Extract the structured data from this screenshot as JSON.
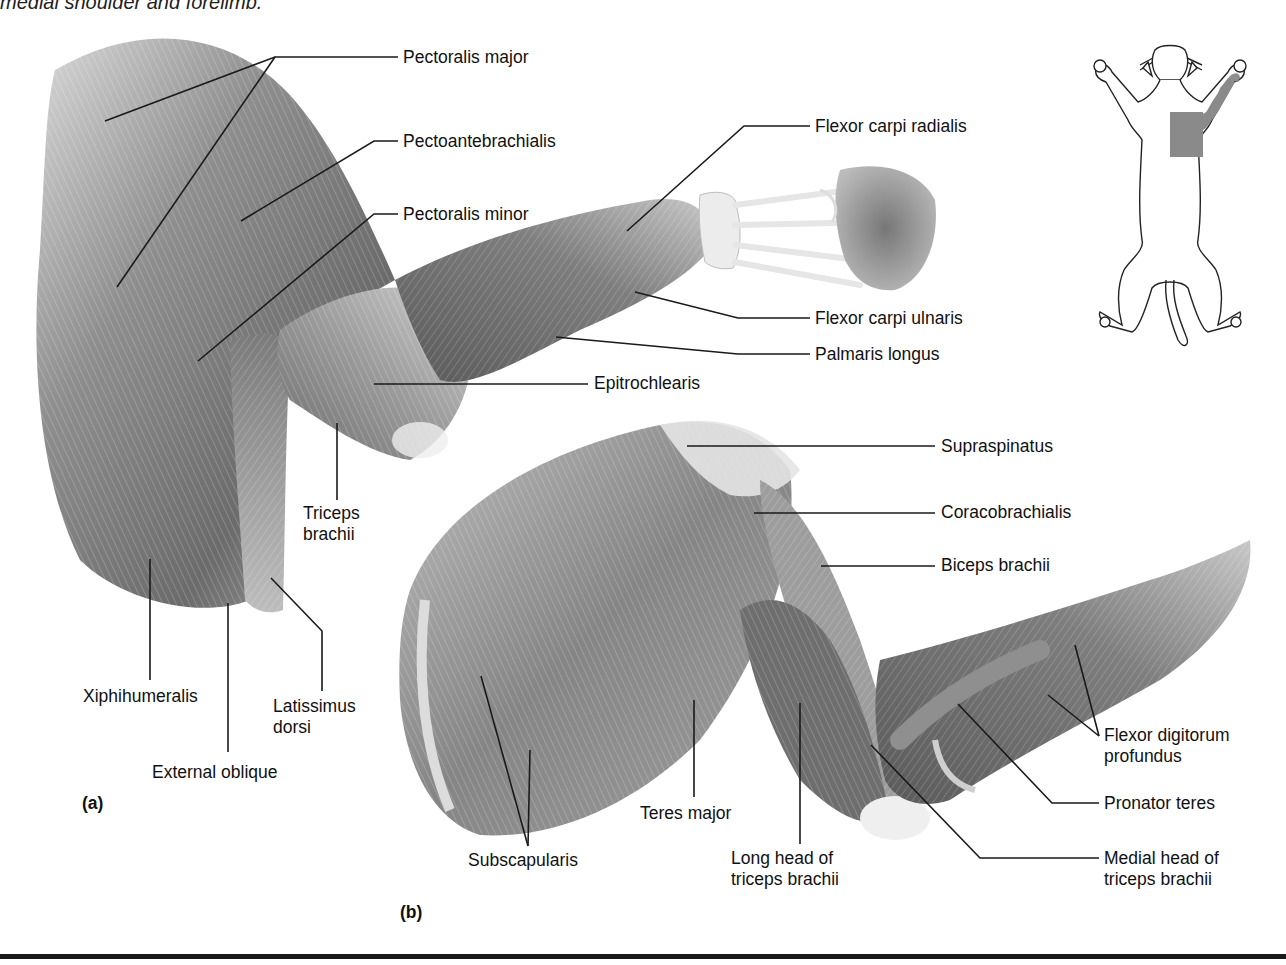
{
  "figure": {
    "caption_fragment": "medial shoulder and forelimb.",
    "panels": [
      {
        "id": "a",
        "letter": "(a)"
      },
      {
        "id": "b",
        "letter": "(b)"
      }
    ],
    "orientation_inset": {
      "description": "Cat outline, ventral view, shaded right shoulder and forelimb region",
      "highlight_color": "#8a8a8a"
    },
    "colors": {
      "muscle_dark": "#4a4a4a",
      "muscle_mid": "#8c8c8c",
      "muscle_light": "#d6d6d6",
      "tendon": "#efefef",
      "leader_line": "#1a1a1a",
      "text": "#111111"
    }
  },
  "labels": {
    "pectoralis_major": {
      "text": "Pectoralis major",
      "x": 403,
      "y": 47
    },
    "pectoantebrachialis": {
      "text": "Pectoantebrachialis",
      "x": 403,
      "y": 131
    },
    "pectoralis_minor": {
      "text": "Pectoralis minor",
      "x": 403,
      "y": 204
    },
    "flexor_carpi_radialis": {
      "text": "Flexor carpi radialis",
      "x": 815,
      "y": 116
    },
    "flexor_carpi_ulnaris": {
      "text": "Flexor carpi ulnaris",
      "x": 815,
      "y": 308
    },
    "palmaris_longus": {
      "text": "Palmaris longus",
      "x": 815,
      "y": 344
    },
    "epitrochlearis": {
      "text": "Epitrochlearis",
      "x": 594,
      "y": 373
    },
    "triceps_brachii_a": {
      "text": [
        "Triceps",
        "brachii"
      ],
      "x": 303,
      "y": 503
    },
    "xiphihumeralis": {
      "text": "Xiphihumeralis",
      "x": 83,
      "y": 686
    },
    "latissimus_dorsi": {
      "text": [
        "Latissimus",
        "dorsi"
      ],
      "x": 273,
      "y": 696
    },
    "external_oblique": {
      "text": "External oblique",
      "x": 152,
      "y": 762
    },
    "supraspinatus": {
      "text": "Supraspinatus",
      "x": 941,
      "y": 436
    },
    "coracobrachialis": {
      "text": "Coracobrachialis",
      "x": 941,
      "y": 502
    },
    "biceps_brachii": {
      "text": "Biceps brachii",
      "x": 941,
      "y": 555
    },
    "flexor_digitorum_profundus": {
      "text": [
        "Flexor digitorum",
        "profundus"
      ],
      "x": 1104,
      "y": 725
    },
    "pronator_teres": {
      "text": "Pronator teres",
      "x": 1104,
      "y": 793
    },
    "medial_head_triceps": {
      "text": [
        "Medial head of",
        "triceps brachii"
      ],
      "x": 1104,
      "y": 848
    },
    "subscapularis": {
      "text": "Subscapularis",
      "x": 468,
      "y": 850
    },
    "teres_major": {
      "text": "Teres major",
      "x": 640,
      "y": 803
    },
    "long_head_triceps": {
      "text": [
        "Long head of",
        "triceps brachii"
      ],
      "x": 731,
      "y": 848
    }
  },
  "leaders": [
    {
      "label": "pectoralis_major",
      "points": [
        [
          398,
          57
        ],
        [
          275,
          57
        ],
        [
          105,
          121
        ]
      ]
    },
    {
      "label": "pectoralis_major",
      "points": [
        [
          275,
          57
        ],
        [
          117,
          287
        ]
      ]
    },
    {
      "label": "pectoantebrachialis",
      "points": [
        [
          398,
          141
        ],
        [
          374,
          141
        ],
        [
          241,
          221
        ]
      ]
    },
    {
      "label": "pectoralis_minor",
      "points": [
        [
          398,
          214
        ],
        [
          374,
          214
        ],
        [
          198,
          361
        ]
      ]
    },
    {
      "label": "flexor_carpi_radialis",
      "points": [
        [
          810,
          126
        ],
        [
          744,
          126
        ],
        [
          627,
          231
        ]
      ]
    },
    {
      "label": "flexor_carpi_ulnaris",
      "points": [
        [
          810,
          318
        ],
        [
          738,
          318
        ],
        [
          635,
          292
        ]
      ]
    },
    {
      "label": "palmaris_longus",
      "points": [
        [
          810,
          354
        ],
        [
          738,
          354
        ],
        [
          556,
          337
        ]
      ]
    },
    {
      "label": "epitrochlearis",
      "points": [
        [
          588,
          384
        ],
        [
          374,
          384
        ]
      ]
    },
    {
      "label": "triceps_brachii_a",
      "points": [
        [
          337,
          500
        ],
        [
          337,
          423
        ]
      ]
    },
    {
      "label": "xiphihumeralis",
      "points": [
        [
          150,
          680
        ],
        [
          150,
          559
        ]
      ]
    },
    {
      "label": "latissimus_dorsi",
      "points": [
        [
          322,
          691
        ],
        [
          322,
          631
        ],
        [
          271,
          578
        ]
      ]
    },
    {
      "label": "external_oblique",
      "points": [
        [
          228,
          752
        ],
        [
          228,
          603
        ]
      ]
    },
    {
      "label": "supraspinatus",
      "points": [
        [
          935,
          446
        ],
        [
          687,
          446
        ]
      ]
    },
    {
      "label": "coracobrachialis",
      "points": [
        [
          935,
          513
        ],
        [
          754,
          513
        ]
      ]
    },
    {
      "label": "biceps_brachii",
      "points": [
        [
          935,
          566
        ],
        [
          821,
          566
        ]
      ]
    },
    {
      "label": "flexor_digitorum_profundus",
      "points": [
        [
          1099,
          736
        ],
        [
          1075,
          645
        ]
      ]
    },
    {
      "label": "flexor_digitorum_profundus",
      "points": [
        [
          1099,
          736
        ],
        [
          1048,
          695
        ]
      ]
    },
    {
      "label": "pronator_teres",
      "points": [
        [
          1099,
          803
        ],
        [
          1052,
          803
        ],
        [
          958,
          704
        ]
      ]
    },
    {
      "label": "medial_head_triceps",
      "points": [
        [
          1099,
          858
        ],
        [
          980,
          858
        ],
        [
          871,
          745
        ]
      ]
    },
    {
      "label": "subscapularis",
      "points": [
        [
          528,
          846
        ],
        [
          481,
          676
        ]
      ]
    },
    {
      "label": "subscapularis",
      "points": [
        [
          528,
          846
        ],
        [
          530,
          750
        ]
      ]
    },
    {
      "label": "teres_major",
      "points": [
        [
          694,
          797
        ],
        [
          694,
          700
        ]
      ]
    },
    {
      "label": "long_head_triceps",
      "points": [
        [
          800,
          844
        ],
        [
          800,
          703
        ]
      ]
    }
  ],
  "panel_letters": {
    "a": {
      "x": 82,
      "y": 793
    },
    "b": {
      "x": 400,
      "y": 902
    }
  }
}
